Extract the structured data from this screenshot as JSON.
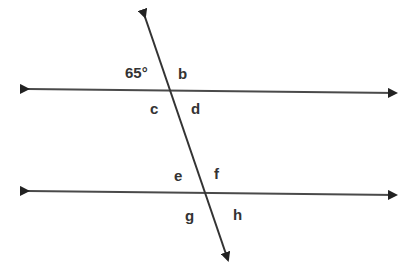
{
  "diagram": {
    "type": "parallel lines cut by a transversal",
    "line_color": "#4a4a4a",
    "arrow_color": "#222222",
    "lines": [
      {
        "name": "upper-parallel-line",
        "from": [
          26,
          89
        ],
        "to": [
          397,
          93
        ]
      },
      {
        "name": "lower-parallel-line",
        "from": [
          26,
          191
        ],
        "to": [
          397,
          195
        ]
      },
      {
        "name": "transversal",
        "from": [
          144,
          15
        ],
        "to": [
          229,
          262
        ]
      }
    ],
    "labels": {
      "angle_given": "65°",
      "b": "b",
      "c": "c",
      "d": "d",
      "e": "e",
      "f": "f",
      "g": "g",
      "h": "h"
    }
  }
}
